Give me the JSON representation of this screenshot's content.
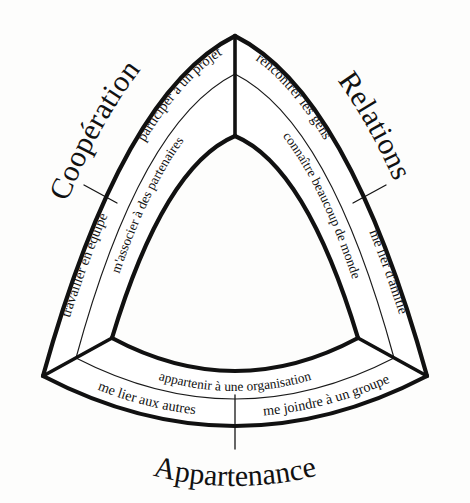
{
  "diagram": {
    "type": "reuleaux-triangle-segmented",
    "background_color": "#fdfdfc",
    "line_color": "#111111",
    "fill_color": "#ffffff",
    "corner_labels": [
      {
        "id": "cooperation",
        "text": "Coopération",
        "position": "upper-left"
      },
      {
        "id": "relations",
        "text": "Relations",
        "position": "upper-right"
      },
      {
        "id": "appartenance",
        "text": "Appartenance",
        "position": "bottom"
      }
    ],
    "sectors": [
      {
        "id": "cooperation",
        "name": "Coopération",
        "inner_cell": {
          "id": "coop-inner",
          "text": "m'associer à des partenaires"
        },
        "outer_cells": [
          {
            "id": "coop-outer-1",
            "text": "participer à un projet"
          },
          {
            "id": "coop-outer-2",
            "text": "travailler en équipe"
          }
        ]
      },
      {
        "id": "relations",
        "name": "Relations",
        "inner_cell": {
          "id": "rel-inner",
          "text": "connaître beaucoup de monde"
        },
        "outer_cells": [
          {
            "id": "rel-outer-1",
            "text": "rencontrer les gens"
          },
          {
            "id": "rel-outer-2",
            "text": "me lier d'amitié"
          }
        ]
      },
      {
        "id": "appartenance",
        "name": "Appartenance",
        "inner_cell": {
          "id": "app-inner",
          "text": "appartenir à une organisation"
        },
        "outer_cells": [
          {
            "id": "app-outer-1",
            "text": "me lier aux autres"
          },
          {
            "id": "app-outer-2",
            "text": "me joindre à un groupe"
          }
        ]
      }
    ],
    "labels": {
      "cooperation": "Coopération",
      "relations": "Relations",
      "appartenance": "Appartenance",
      "participer_projet": "participer à un projet",
      "associer_partenaires": "m'associer à des partenaires",
      "travailler_equipe": "travailler en équipe",
      "rencontrer_gens": "rencontrer les gens",
      "connaitre_monde": "connaître beaucoup de monde",
      "lier_amitie": "me lier d'amitié",
      "appartenir_organisation": "appartenir à une organisation",
      "lier_autres": "me lier aux autres",
      "joindre_groupe": "me joindre à un groupe"
    }
  }
}
